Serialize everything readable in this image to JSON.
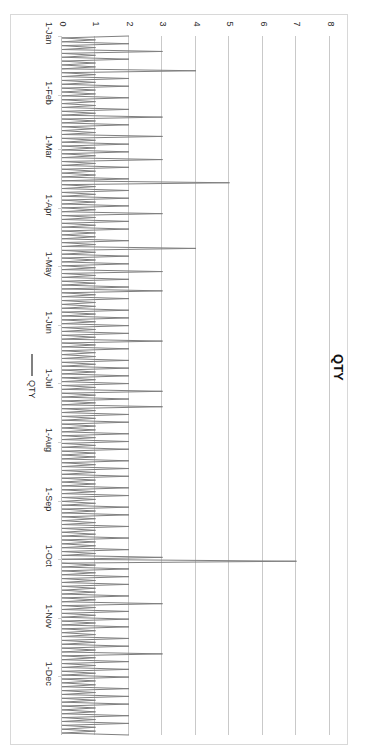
{
  "chart_data": {
    "type": "line",
    "title": "QTY",
    "xlabel": "",
    "ylabel": "",
    "orientation": "rotated-90-clockwise",
    "grid": true,
    "legend_position": "left-middle",
    "legend": [
      "QTY"
    ],
    "series_color": "#808080",
    "ylim": [
      0,
      8
    ],
    "yticks": [
      0,
      1,
      2,
      3,
      4,
      5,
      6,
      7,
      8
    ],
    "ytick_labels": [
      "0",
      "1",
      "2",
      "3",
      "4",
      "5",
      "6",
      "7",
      "8"
    ],
    "xtick_labels": [
      "1-Jan",
      "1-Feb",
      "1-Mar",
      "1-Apr",
      "1-May",
      "1-Jun",
      "1-Jul",
      "1-Aug",
      "1-Sep",
      "1-Oct",
      "1-Nov",
      "1-Dec"
    ],
    "xtick_positions_days": [
      0,
      31,
      59,
      90,
      120,
      151,
      181,
      212,
      243,
      273,
      304,
      334
    ],
    "x_range_days": [
      0,
      365
    ],
    "series": [
      {
        "name": "QTY",
        "values": [
          2,
          0,
          1,
          0,
          2,
          0,
          1,
          0,
          3,
          0,
          1,
          0,
          2,
          0,
          1,
          0,
          1,
          0,
          4,
          0,
          1,
          0,
          2,
          0,
          1,
          0,
          2,
          0,
          1,
          0,
          1,
          0,
          2,
          0,
          1,
          0,
          1,
          0,
          2,
          0,
          1,
          0,
          3,
          0,
          1,
          0,
          2,
          0,
          1,
          0,
          1,
          0,
          3,
          0,
          1,
          0,
          2,
          0,
          1,
          0,
          2,
          0,
          1,
          0,
          3,
          0,
          1,
          0,
          2,
          0,
          1,
          0,
          1,
          0,
          2,
          0,
          5,
          0,
          1,
          0,
          2,
          0,
          1,
          0,
          2,
          0,
          1,
          0,
          2,
          0,
          1,
          0,
          3,
          0,
          1,
          0,
          2,
          0,
          1,
          0,
          2,
          0,
          1,
          0,
          1,
          0,
          2,
          0,
          1,
          0,
          4,
          0,
          1,
          0,
          2,
          0,
          1,
          0,
          2,
          0,
          1,
          0,
          3,
          0,
          1,
          0,
          2,
          0,
          1,
          0,
          2,
          0,
          3,
          0,
          1,
          0,
          2,
          0,
          1,
          0,
          1,
          0,
          2,
          0,
          1,
          0,
          2,
          0,
          1,
          0,
          2,
          0,
          1,
          0,
          2,
          0,
          1,
          0,
          3,
          0,
          1,
          0,
          2,
          0,
          1,
          0,
          1,
          0,
          2,
          0,
          1,
          0,
          2,
          0,
          1,
          0,
          2,
          0,
          1,
          0,
          2,
          0,
          1,
          0,
          3,
          0,
          1,
          0,
          2,
          0,
          1,
          0,
          3,
          0,
          1,
          0,
          2,
          0,
          1,
          0,
          2,
          0,
          1,
          0,
          1,
          0,
          2,
          0,
          1,
          0,
          2,
          0,
          1,
          0,
          2,
          0,
          1,
          0,
          1,
          0,
          2,
          0,
          1,
          0,
          2,
          0,
          1,
          0,
          2,
          0,
          1,
          0,
          1,
          0,
          2,
          0,
          1,
          0,
          2,
          0,
          1,
          0,
          1,
          0,
          2,
          0,
          1,
          0,
          2,
          0,
          1,
          0,
          1,
          0,
          2,
          0,
          1,
          0,
          1,
          0,
          2,
          0,
          1,
          0,
          1,
          0,
          2,
          0,
          1,
          0,
          3,
          0,
          7,
          0,
          1,
          0,
          2,
          0,
          1,
          0,
          2,
          0,
          1,
          0,
          2,
          0,
          1,
          0,
          1,
          0,
          2,
          0,
          1,
          0,
          3,
          0,
          1,
          0,
          2,
          0,
          1,
          0,
          2,
          0,
          1,
          0,
          2,
          0,
          1,
          0,
          1,
          0,
          2,
          0,
          1,
          0,
          2,
          0,
          1,
          0,
          3,
          0,
          1,
          0,
          2,
          0,
          1,
          0,
          2,
          0,
          1,
          0,
          2,
          0,
          1,
          0,
          1,
          0,
          2,
          0,
          1,
          0,
          2,
          0,
          1,
          0,
          2,
          0,
          1,
          0,
          1,
          0,
          2,
          0,
          1,
          0,
          2,
          0,
          1,
          0,
          1,
          0,
          2
        ]
      }
    ]
  },
  "axis": {
    "value_axis_title": "",
    "category_axis_title": ""
  }
}
